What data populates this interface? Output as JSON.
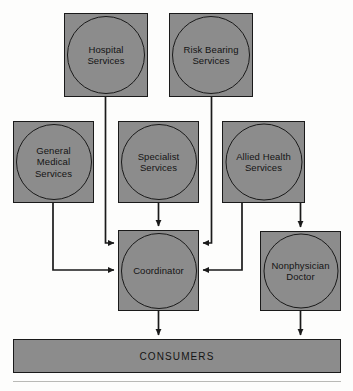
{
  "diagram": {
    "type": "flowchart",
    "title": "",
    "fill_color": "#8c8c8c",
    "stroke_color": "#1a1a1a",
    "background_color": "#fdfdfc",
    "nodes": [
      {
        "id": "hospital-services",
        "label": "Hospital\nServices",
        "x": 64,
        "y": 13,
        "w": 84,
        "h": 84,
        "circle": 78
      },
      {
        "id": "risk-bearing-services",
        "label": "Risk Bearing\nServices",
        "x": 169,
        "y": 13,
        "w": 84,
        "h": 84,
        "circle": 78
      },
      {
        "id": "general-medical-services",
        "label": "General\nMedical\nServices",
        "x": 13,
        "y": 121,
        "w": 81,
        "h": 82,
        "circle": 76
      },
      {
        "id": "specialist-services",
        "label": "Specialist\nServices",
        "x": 118,
        "y": 121,
        "w": 81,
        "h": 82,
        "circle": 76
      },
      {
        "id": "allied-health-services",
        "label": "Allied Health\nServices",
        "x": 222,
        "y": 121,
        "w": 83,
        "h": 82,
        "circle": 77
      },
      {
        "id": "coordinator",
        "label": "Coordinator",
        "x": 118,
        "y": 230,
        "w": 81,
        "h": 81,
        "circle": 76
      },
      {
        "id": "nonphysician-doctor",
        "label": "Nonphysician\nDoctor",
        "x": 260,
        "y": 231,
        "w": 81,
        "h": 80,
        "circle": 75
      }
    ],
    "consumers": {
      "id": "consumers-bar",
      "label": "CONSUMERS",
      "x": 13,
      "y": 339,
      "w": 328,
      "h": 34
    },
    "bottom_rule": {
      "x": 13,
      "y": 381,
      "w": 328
    },
    "edges": [
      {
        "id": "hospital-to-coordinator",
        "from": "hospital-services",
        "to": "coordinator",
        "path": "M 105.5 97 L 105.5 243 L 114 243"
      },
      {
        "id": "risk-bearing-to-coordinator",
        "from": "risk-bearing-services",
        "to": "coordinator",
        "path": "M 211.5 97 L 211.5 243 L 203 243"
      },
      {
        "id": "general-medical-to-coordinator",
        "from": "general-medical-services",
        "to": "coordinator",
        "path": "M 53 203 L 53 270 L 114 270"
      },
      {
        "id": "specialist-to-coordinator",
        "from": "specialist-services",
        "to": "coordinator",
        "path": "M 158.5 203 L 158.5 226"
      },
      {
        "id": "allied-health-to-coordinator",
        "from": "allied-health-services",
        "to": "coordinator",
        "path": "M 242 203 L 242 270 L 203 270"
      },
      {
        "id": "allied-health-to-nonphysician",
        "from": "allied-health-services",
        "to": "nonphysician-doctor",
        "path": "M 300.5 203 L 300.5 227"
      },
      {
        "id": "coordinator-to-consumers",
        "from": "coordinator",
        "to": "consumers-bar",
        "path": "M 158.5 311 L 158.5 335"
      },
      {
        "id": "nonphysician-to-consumers",
        "from": "nonphysician-doctor",
        "to": "consumers-bar",
        "path": "M 300.5 311 L 300.5 335"
      }
    ]
  }
}
